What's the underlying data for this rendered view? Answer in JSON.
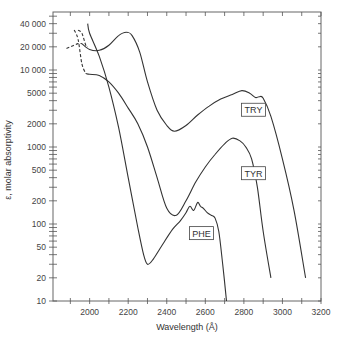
{
  "chart_data": {
    "type": "line",
    "title": "",
    "xlabel": "Wavelength (Å)",
    "ylabel": "ε, molar absorptivity",
    "xscale": "linear",
    "yscale": "log",
    "xlim": [
      1810,
      3200
    ],
    "ylim": [
      10,
      50000
    ],
    "grid": false,
    "legend_position": "inline labels",
    "x_ticks": [
      2000,
      2200,
      2400,
      2600,
      2800,
      3000,
      3200
    ],
    "x_tick_labels": [
      "2000",
      "2200",
      "2400",
      "2600",
      "2800",
      "3000",
      "3200"
    ],
    "y_ticks": [
      10,
      20,
      50,
      100,
      200,
      500,
      1000,
      2000,
      5000,
      10000,
      20000,
      40000
    ],
    "y_tick_labels": [
      "10",
      "20",
      "50",
      "100",
      "200",
      "500",
      "1000",
      "2000",
      "5000",
      "10 000",
      "20 000",
      "40 000"
    ],
    "series": [
      {
        "name": "TRY",
        "style": "solid",
        "x": [
          1960,
          2000,
          2050,
          2100,
          2150,
          2190,
          2220,
          2260,
          2300,
          2350,
          2400,
          2440,
          2500,
          2560,
          2620,
          2680,
          2740,
          2790,
          2830,
          2860,
          2880,
          2900,
          2940,
          3000,
          3060,
          3120
        ],
        "values": [
          22000,
          18500,
          18000,
          21000,
          28000,
          31000,
          28000,
          17000,
          7000,
          3000,
          1900,
          1600,
          1900,
          2600,
          3400,
          4200,
          4800,
          5400,
          5000,
          4400,
          4500,
          4300,
          2500,
          700,
          150,
          20
        ]
      },
      {
        "name": "TRY (dashed, far UV)",
        "style": "dashed",
        "x": [
          1880,
          1910,
          1940,
          1960
        ],
        "values": [
          19000,
          20500,
          22000,
          22000
        ]
      },
      {
        "name": "TYR",
        "style": "solid",
        "x": [
          1980,
          2000,
          2050,
          2100,
          2150,
          2200,
          2250,
          2300,
          2350,
          2400,
          2450,
          2500,
          2550,
          2600,
          2650,
          2700,
          2740,
          2780,
          2810,
          2840,
          2870,
          2900,
          2940
        ],
        "values": [
          9000,
          8800,
          8500,
          7000,
          5000,
          3200,
          2000,
          1000,
          400,
          160,
          130,
          200,
          350,
          550,
          800,
          1100,
          1300,
          1200,
          1000,
          700,
          300,
          80,
          20
        ]
      },
      {
        "name": "TYR (dashed, far UV)",
        "style": "dashed",
        "x": [
          1920,
          1940,
          1960,
          1980
        ],
        "values": [
          33000,
          25000,
          12000,
          9000
        ]
      },
      {
        "name": "PHE",
        "style": "solid",
        "x": [
          1990,
          2000,
          2050,
          2100,
          2150,
          2200,
          2250,
          2280,
          2300,
          2330,
          2380,
          2430,
          2470,
          2500,
          2520,
          2540,
          2560,
          2575,
          2590,
          2610,
          2630,
          2650,
          2670,
          2690,
          2710
        ],
        "values": [
          40000,
          30000,
          15000,
          6000,
          1800,
          400,
          90,
          40,
          30,
          35,
          55,
          85,
          110,
          140,
          170,
          150,
          190,
          170,
          160,
          140,
          130,
          120,
          80,
          30,
          10
        ]
      },
      {
        "name": "PHE (dashed, far UV)",
        "style": "dashed",
        "x": [
          1940,
          1960,
          1980,
          1990
        ],
        "values": [
          33000,
          30000,
          21000,
          20000
        ]
      }
    ],
    "annotations": [
      {
        "text": "TRY",
        "x": 2850,
        "y": 3000
      },
      {
        "text": "TYR",
        "x": 2850,
        "y": 450
      },
      {
        "text": "PHE",
        "x": 2580,
        "y": 75
      }
    ]
  },
  "labels": {
    "xlabel": "Wavelength (Å)",
    "ylabel": "ε, molar absorptivity",
    "try": "TRY",
    "tyr": "TYR",
    "phe": "PHE"
  }
}
